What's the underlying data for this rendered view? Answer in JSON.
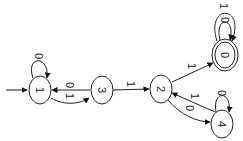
{
  "diagram": {
    "type": "finite-automaton",
    "orientation": "rotated-90-clockwise",
    "start_state": "1",
    "states": [
      {
        "id": "1",
        "label": "1",
        "accepting": false
      },
      {
        "id": "3",
        "label": "3",
        "accepting": false
      },
      {
        "id": "2",
        "label": "2",
        "accepting": false
      },
      {
        "id": "0",
        "label": "0",
        "accepting": true
      },
      {
        "id": "4",
        "label": "4",
        "accepting": false
      }
    ],
    "transitions": [
      {
        "from": "1",
        "to": "1",
        "label": "0"
      },
      {
        "from": "1",
        "to": "3",
        "label": "1"
      },
      {
        "from": "3",
        "to": "1",
        "label": "0"
      },
      {
        "from": "3",
        "to": "2",
        "label": "1"
      },
      {
        "from": "2",
        "to": "0",
        "label": "1"
      },
      {
        "from": "2",
        "to": "4",
        "label": "0"
      },
      {
        "from": "4",
        "to": "2",
        "label": "1"
      },
      {
        "from": "4",
        "to": "4",
        "label": "0"
      },
      {
        "from": "0",
        "to": "0",
        "label": "0"
      },
      {
        "from": "0",
        "to": "0",
        "label": "1"
      }
    ]
  }
}
